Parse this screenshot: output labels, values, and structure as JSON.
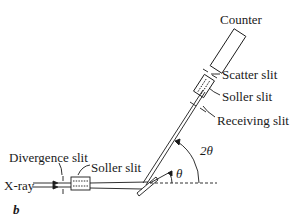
{
  "diagram": {
    "type": "x-ray diffractometer schematic",
    "panel_label": "b",
    "labels": {
      "counter": "Counter",
      "scatter_slit": "Scatter slit",
      "soller_slit_receiving_side": "Soller slit",
      "receiving_slit": "Receiving slit",
      "divergence_slit": "Divergence slit",
      "soller_slit_source_side": "Soller slit",
      "xray": "X-ray",
      "angle_theta": "θ",
      "angle_two_theta": "2θ"
    },
    "colors": {
      "line": "#1a1a1a",
      "background": "#ffffff"
    }
  }
}
